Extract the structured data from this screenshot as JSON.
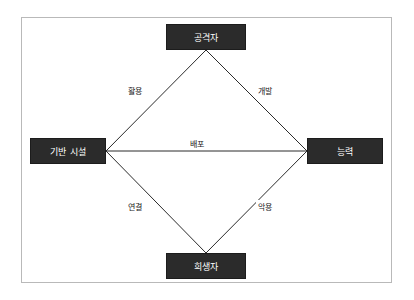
{
  "diagram": {
    "type": "diamond-model",
    "nodes": [
      {
        "id": "attacker",
        "label": "공격자",
        "position": "top"
      },
      {
        "id": "infrastructure",
        "label": "기반 시설",
        "position": "left"
      },
      {
        "id": "capability",
        "label": "능력",
        "position": "right"
      },
      {
        "id": "victim",
        "label": "희생자",
        "position": "bottom"
      }
    ],
    "edges": [
      {
        "id": "exploit-use",
        "label": "활용",
        "from": "attacker",
        "to": "infrastructure"
      },
      {
        "id": "develop",
        "label": "개발",
        "from": "attacker",
        "to": "capability"
      },
      {
        "id": "deploy",
        "label": "배포",
        "from": "infrastructure",
        "to": "capability"
      },
      {
        "id": "connect",
        "label": "연결",
        "from": "infrastructure",
        "to": "victim"
      },
      {
        "id": "abuse",
        "label": "악용",
        "from": "victim",
        "to": "capability"
      }
    ],
    "colors": {
      "node_fill": "#2b2b2b",
      "node_text": "#ffffff",
      "edge_line": "#2b2b2b",
      "frame_border": "#b9b9b9",
      "background": "#ffffff"
    }
  }
}
